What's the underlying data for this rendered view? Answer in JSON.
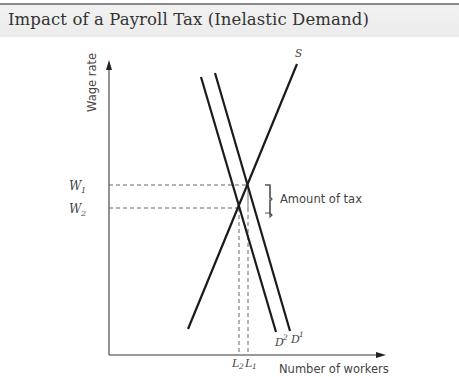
{
  "header": {
    "title": "Impact of a Payroll Tax (Inelastic Demand)"
  },
  "diagram": {
    "y_axis_label": "Wage rate",
    "x_axis_label": "Number of workers",
    "curves": {
      "supply_label": "S",
      "demand_before_label": "D",
      "demand_before_sup": "1",
      "demand_after_label": "D",
      "demand_after_sup": "2"
    },
    "wage_levels": {
      "w1_label": "W",
      "w1_sub": "1",
      "w2_label": "W",
      "w2_sub": "2"
    },
    "labor_levels": {
      "l2_label": "L",
      "l2_sub": "2",
      "l1_label": "L",
      "l1_sub": "1"
    },
    "annotation": "Amount of tax",
    "colors": {
      "curve": "#1a1a1a",
      "axis": "#777777",
      "guide": "#666666",
      "header_band": "#eeeeee"
    }
  }
}
